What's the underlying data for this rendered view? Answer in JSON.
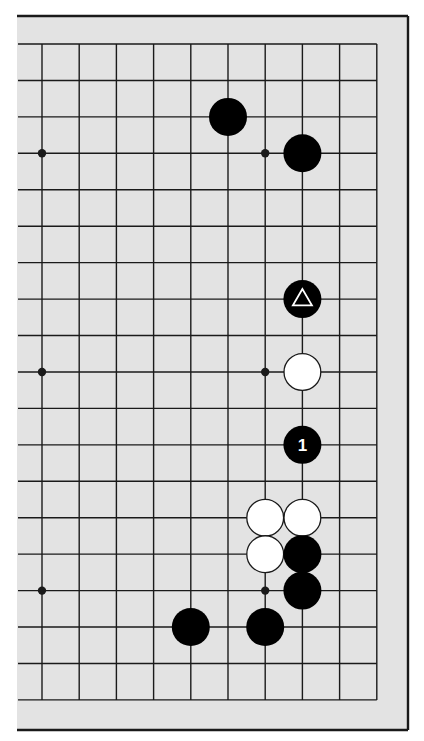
{
  "diagram": {
    "type": "go-board-partial",
    "colors": {
      "page_background": "#ffffff",
      "board_background": "#e3e3e3",
      "grid_line": "#1a1a1a",
      "frame_line": "#1a1a1a",
      "black_stone": "#000000",
      "white_stone": "#ffffff",
      "white_stone_outline": "#1a1a1a",
      "marker": "#ffffff"
    },
    "board_area": {
      "left": 17,
      "top": 16,
      "right": 408,
      "bottom": 730
    },
    "grid": {
      "columns": 10,
      "rows": 19,
      "origin_x": 42,
      "origin_y": 44,
      "spacing_x": 37.2,
      "spacing_y": 36.44,
      "left_line_extent_x": 18,
      "open_left_edge": true
    },
    "star_points": [
      {
        "col": 0,
        "row": 3
      },
      {
        "col": 6,
        "row": 3
      },
      {
        "col": 0,
        "row": 9
      },
      {
        "col": 6,
        "row": 9
      },
      {
        "col": 0,
        "row": 15
      },
      {
        "col": 6,
        "row": 15
      }
    ],
    "stones": [
      {
        "col": 5,
        "row": 2,
        "color": "black",
        "marker": "",
        "label": ""
      },
      {
        "col": 7,
        "row": 3,
        "color": "black",
        "marker": "",
        "label": ""
      },
      {
        "col": 7,
        "row": 7,
        "color": "black",
        "marker": "triangle",
        "label": ""
      },
      {
        "col": 7,
        "row": 9,
        "color": "white",
        "marker": "",
        "label": ""
      },
      {
        "col": 7,
        "row": 11,
        "color": "black",
        "marker": "",
        "label": "1"
      },
      {
        "col": 6,
        "row": 13,
        "color": "white",
        "marker": "",
        "label": ""
      },
      {
        "col": 7,
        "row": 13,
        "color": "white",
        "marker": "",
        "label": ""
      },
      {
        "col": 6,
        "row": 14,
        "color": "white",
        "marker": "",
        "label": ""
      },
      {
        "col": 7,
        "row": 14,
        "color": "black",
        "marker": "",
        "label": ""
      },
      {
        "col": 7,
        "row": 15,
        "color": "black",
        "marker": "",
        "label": ""
      },
      {
        "col": 4,
        "row": 16,
        "color": "black",
        "marker": "",
        "label": ""
      },
      {
        "col": 6,
        "row": 16,
        "color": "black",
        "marker": "",
        "label": ""
      }
    ],
    "stone_radius": 19,
    "move_labels": [
      "1"
    ]
  }
}
